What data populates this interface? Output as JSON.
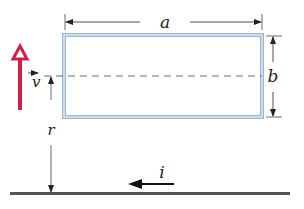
{
  "diagram": {
    "labels": {
      "width": "a",
      "height": "b",
      "distance": "r",
      "velocity": "v",
      "current": "i"
    },
    "colors": {
      "loop": "#9db8d2",
      "velocity_arrow": "#d0204a",
      "lines": "#222222",
      "wire": "#555555"
    },
    "elements": [
      "rectangular conducting loop (width a, height b)",
      "long straight wire carrying current i to the left",
      "velocity vector v pointing up",
      "distance r from wire to loop center line"
    ]
  }
}
